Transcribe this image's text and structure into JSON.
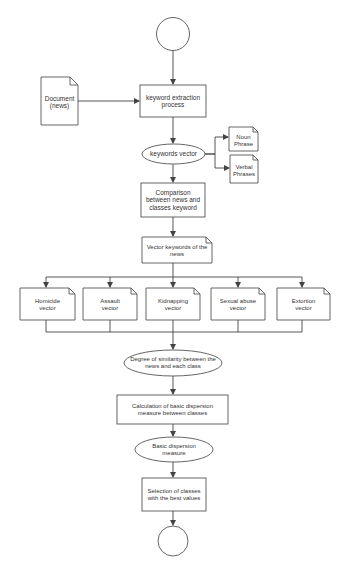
{
  "diagram": {
    "type": "flowchart",
    "colors": {
      "stroke": "#555555",
      "fill": "#ffffff",
      "text": "#333333"
    },
    "nodes": {
      "start": {
        "shape": "circle",
        "label": ""
      },
      "document": {
        "shape": "document",
        "line1": "Document",
        "line2": "(news)"
      },
      "keyword_extraction": {
        "shape": "process",
        "line1": "keyword extraction",
        "line2": "process"
      },
      "keywords_vector": {
        "shape": "ellipse",
        "line1": "keywords vector"
      },
      "noun_phrase": {
        "shape": "document",
        "line1": "Noun",
        "line2": "Phrase"
      },
      "verbal_phrases": {
        "shape": "document",
        "line1": "Verbal",
        "line2": "Phrases"
      },
      "comparison": {
        "shape": "process",
        "line1": "Comparison",
        "line2": "between news and",
        "line3": "classes keyword"
      },
      "vector_keywords": {
        "shape": "document",
        "line1": "Vector keywords of the",
        "line2": "news"
      },
      "class_vectors": [
        {
          "line1": "Homicide",
          "line2": "vector"
        },
        {
          "line1": "Assault",
          "line2": "vector"
        },
        {
          "line1": "Kidnapping",
          "line2": "vector"
        },
        {
          "line1": "Sexual abuse",
          "line2": "vector"
        },
        {
          "line1": "Extortion",
          "line2": "vector"
        }
      ],
      "degree_similarity": {
        "shape": "ellipse",
        "line1": "Degree of similarity between the",
        "line2": "news and each class"
      },
      "calculation": {
        "shape": "process",
        "line1": "Calculation of basic dispersion",
        "line2": "measure between classes"
      },
      "basic_dispersion": {
        "shape": "ellipse",
        "line1": "Basic dispersion",
        "line2": "measure"
      },
      "selection": {
        "shape": "process",
        "line1": "Selection of classes",
        "line2": "with the best values"
      },
      "end": {
        "shape": "circle",
        "label": ""
      }
    }
  }
}
